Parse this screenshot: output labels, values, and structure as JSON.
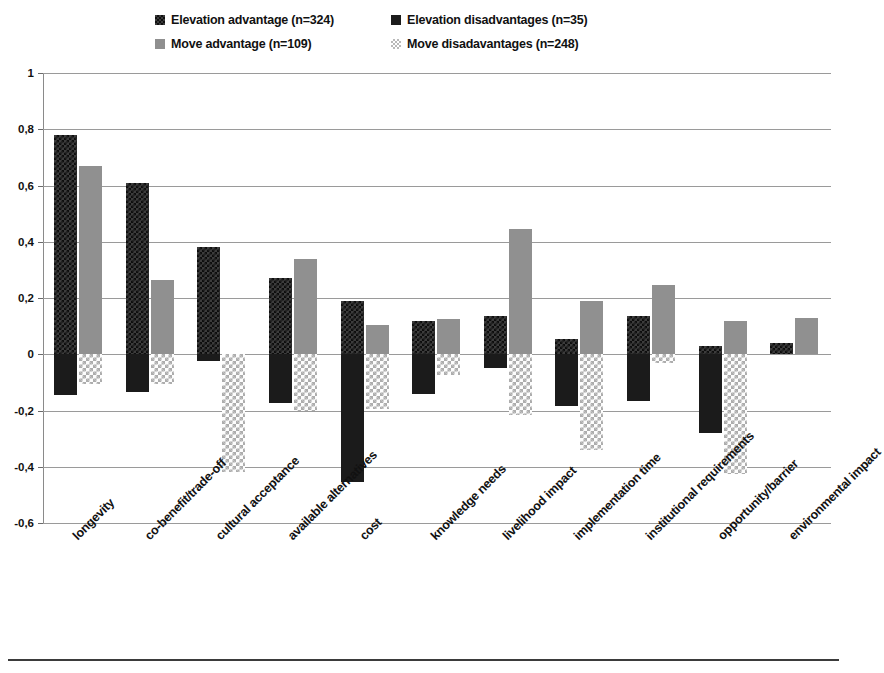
{
  "legend": {
    "entries": [
      {
        "label": "Elevation advantage (n=324)",
        "swatch": "elev-adv",
        "color": "#3c3c3c"
      },
      {
        "label": "Elevation disadvantages (n=35)",
        "swatch": "elev-dis",
        "color": "#1b1b1b"
      },
      {
        "label": "Move advantage (n=109)",
        "swatch": "move-adv",
        "color": "#909090"
      },
      {
        "label": "Move disadavantages (n=248)",
        "swatch": "move-dis",
        "color": "#adadad"
      }
    ]
  },
  "axis": {
    "y_ticks": [
      "1",
      "0,8",
      "0,6",
      "0,4",
      "0,2",
      "0",
      "-0,2",
      "-0,4",
      "-0,6"
    ]
  },
  "chart_data": {
    "type": "bar",
    "title": "",
    "xlabel": "",
    "ylabel": "",
    "ylim": [
      -0.6,
      1.0
    ],
    "ytick_values": [
      1,
      0.8,
      0.6,
      0.4,
      0.2,
      0,
      -0.2,
      -0.4,
      -0.6
    ],
    "grid": true,
    "legend_position": "top",
    "orientation": "vertical-grouped",
    "categories": [
      "longevity",
      "co-benefit/trade-off",
      "cultural acceptance",
      "available alternatives",
      "cost",
      "knowledge needs",
      "livelihood impact",
      "implementation time",
      "institutional requirements",
      "opportunity/barrier",
      "environmental impact"
    ],
    "series": [
      {
        "name": "Elevation advantage (n=324)",
        "color": "#3c3c3c",
        "values": [
          0.78,
          0.61,
          0.38,
          0.27,
          0.19,
          0.12,
          0.135,
          0.055,
          0.135,
          0.03,
          0.04
        ]
      },
      {
        "name": "Elevation disadvantages (n=35)",
        "color": "#1b1b1b",
        "values": [
          -0.145,
          -0.135,
          -0.025,
          -0.175,
          -0.455,
          -0.14,
          -0.05,
          -0.185,
          -0.165,
          -0.28,
          0.0
        ]
      },
      {
        "name": "Move advantage (n=109)",
        "color": "#909090",
        "values": [
          0.67,
          0.265,
          0.0,
          0.34,
          0.105,
          0.125,
          0.445,
          0.19,
          0.245,
          0.12,
          0.13
        ]
      },
      {
        "name": "Move disadavantages (n=248)",
        "color": "#adadad",
        "values": [
          -0.105,
          -0.105,
          -0.42,
          -0.2,
          -0.195,
          -0.075,
          -0.215,
          -0.34,
          -0.03,
          -0.425,
          0.0
        ]
      }
    ]
  }
}
